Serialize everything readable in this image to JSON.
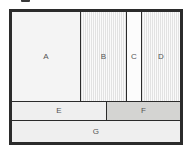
{
  "figure": {
    "kind": "rectangle-packing-diagram",
    "outer_border_color": "#2b2b2b",
    "background_color": "#ffffff",
    "label_color": "#555555"
  },
  "regions": [
    {
      "id": "A",
      "label": "A",
      "fill": "plain",
      "fill_color": "#f4f4f4",
      "row": "top"
    },
    {
      "id": "B",
      "label": "B",
      "fill": "hatched",
      "fill_color": "#f3f3f3",
      "row": "top"
    },
    {
      "id": "C",
      "label": "C",
      "fill": "white",
      "fill_color": "#fcfcfc",
      "row": "top"
    },
    {
      "id": "D",
      "label": "D",
      "fill": "hatched",
      "fill_color": "#f3f3f3",
      "row": "top"
    },
    {
      "id": "E",
      "label": "E",
      "fill": "gray",
      "fill_color": "#efefef",
      "row": "middle"
    },
    {
      "id": "F",
      "label": "F",
      "fill": "dark-gray",
      "fill_color": "#d4d4d2",
      "row": "middle"
    },
    {
      "id": "G",
      "label": "G",
      "fill": "gray",
      "fill_color": "#efefef",
      "row": "bottom"
    }
  ]
}
